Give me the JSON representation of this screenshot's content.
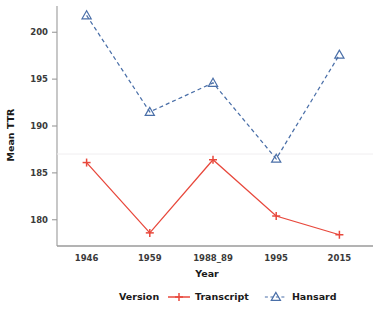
{
  "chart_data": {
    "type": "line",
    "title": "",
    "xlabel": "Year",
    "ylabel": "Mean TTR",
    "categories": [
      "1946",
      "1959",
      "1988_89",
      "1995",
      "2015"
    ],
    "series": [
      {
        "name": "Transcript",
        "color": "#e8483c",
        "marker": "plus",
        "linestyle": "solid",
        "values": [
          186.1,
          178.6,
          186.4,
          180.4,
          178.4
        ]
      },
      {
        "name": "Hansard",
        "color": "#4a6fa8",
        "marker": "triangle-up",
        "linestyle": "dashed",
        "values": [
          201.8,
          191.5,
          194.6,
          186.5,
          197.6
        ]
      }
    ],
    "ylim": [
      177.2,
      202.8
    ],
    "yticks": [
      180,
      185,
      190,
      195,
      200
    ],
    "ytick_labels": [
      "180",
      "185",
      "190",
      "195",
      "200"
    ],
    "grid": false,
    "legend": {
      "position": "bottom",
      "title": "Version",
      "entries": [
        "Transcript",
        "Hansard"
      ]
    }
  },
  "axes": {
    "y_title": "Mean TTR",
    "x_title": "Year"
  },
  "colors": {
    "transcript": "#e8483c",
    "hansard": "#4a6fa8",
    "axis": "#9a9a9a",
    "text": "#1a1a1a"
  }
}
